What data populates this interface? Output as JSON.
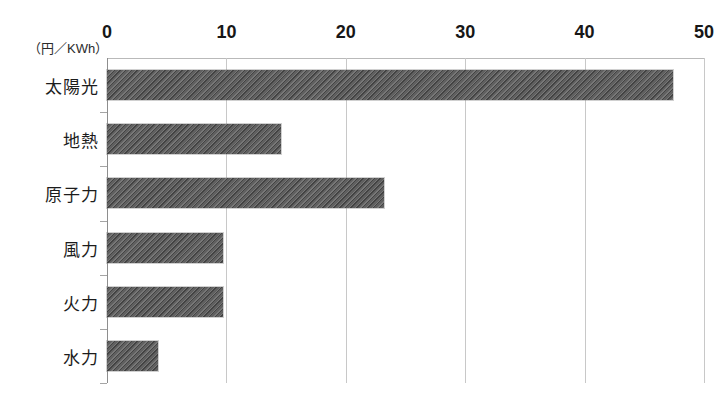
{
  "chart_data": {
    "type": "bar",
    "orientation": "horizontal",
    "title": "",
    "subtitle": "",
    "xlabel": "",
    "ylabel": "",
    "unit_caption": "（円／KWh）",
    "categories": [
      "太陽光",
      "地熱",
      "原子力",
      "風力",
      "火力",
      "水力"
    ],
    "values": [
      47.4,
      14.6,
      23.2,
      9.7,
      9.7,
      4.3
    ],
    "xlim": [
      0,
      50
    ],
    "xticks": [
      0,
      10,
      20,
      30,
      40,
      50
    ],
    "xtick_labels": [
      "0",
      "10",
      "20",
      "30",
      "40",
      "50"
    ],
    "grid": true,
    "grid_axis": "x",
    "legend": false,
    "legend_position": "none",
    "series": [
      {
        "name": "発電コスト",
        "values": [
          47.4,
          14.6,
          23.2,
          9.7,
          9.7,
          4.3
        ]
      }
    ],
    "colors": {
      "bar_fill": "#565656",
      "bar_hatch": "#2f2f2f",
      "gridline": "#c8c8c8",
      "axis": "#8e8e8e",
      "text": "#1b1b1b",
      "background": "#ffffff"
    }
  }
}
